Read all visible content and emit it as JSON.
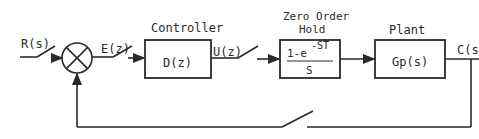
{
  "diagram": {
    "type": "sampled-data closed-loop control system block diagram",
    "signals": {
      "input": "R(s)",
      "error": "E(z)",
      "control": "U(z)",
      "output": "C(s"
    },
    "blocks": [
      {
        "id": "controller",
        "title": "Controller",
        "content": "D(z)"
      },
      {
        "id": "zoh",
        "title_line1": "Zero Order",
        "title_line2": "Hold",
        "numerator": "1-e",
        "exponent": "-ST",
        "denominator": "S"
      },
      {
        "id": "plant",
        "title": "Plant",
        "content": "Gp(s)"
      }
    ],
    "summing_junction": {
      "symbol": "⊗"
    },
    "switches": [
      "input-sampler",
      "error-sampler",
      "control-sampler",
      "feedback-sampler"
    ],
    "stroke_color": "#2a2a2a",
    "background": "#ffffff"
  }
}
